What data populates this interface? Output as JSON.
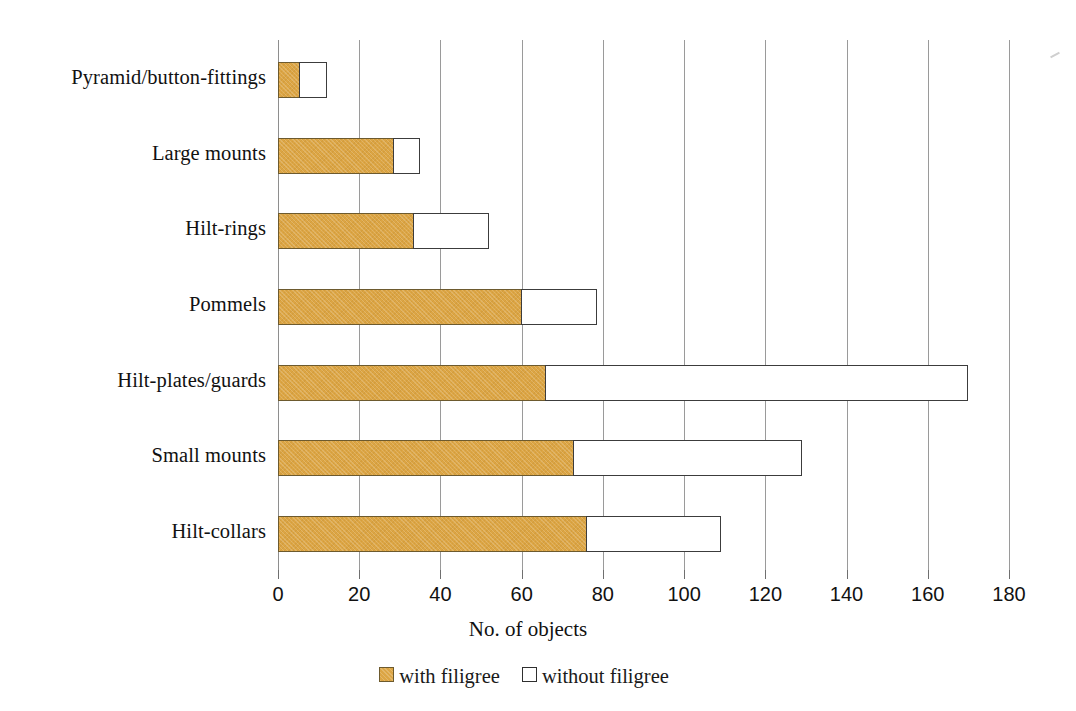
{
  "chart_data": {
    "type": "bar",
    "orientation": "horizontal",
    "stacked": true,
    "title": "",
    "xlabel": "No. of objects",
    "ylabel": "",
    "xlim": [
      0,
      180
    ],
    "xticks": [
      0,
      20,
      40,
      60,
      80,
      100,
      120,
      140,
      160,
      180
    ],
    "xtick_labels": [
      "0",
      "20",
      "40",
      "60",
      "80",
      "100",
      "120",
      "140",
      "160",
      "180"
    ],
    "grid": true,
    "grid_axis": "x",
    "legend_position": "bottom",
    "categories": [
      "Pyramid/button-fittings",
      "Large mounts",
      "Hilt-rings",
      "Pommels",
      "Hilt-plates/guards",
      "Small mounts",
      "Hilt-collars"
    ],
    "series": [
      {
        "name": "with filigree",
        "color": "#dca544",
        "values": [
          5.5,
          28.5,
          33.5,
          60,
          66,
          73,
          76
        ]
      },
      {
        "name": "without filigree",
        "color": "#ffffff",
        "values": [
          6.5,
          6.5,
          18.5,
          18.5,
          104,
          56,
          33
        ]
      }
    ],
    "totals": [
      12,
      35,
      52,
      78.5,
      170,
      129,
      109
    ]
  },
  "legend": {
    "items": [
      {
        "label": "with filigree",
        "swatch": "filigree-swatch"
      },
      {
        "label": "without filigree",
        "swatch": "plain-swatch"
      }
    ]
  },
  "colors": {
    "filigree_fill": "#dca544",
    "filigree_border": "#6d5a2e",
    "plain_fill": "#ffffff",
    "plain_border": "#3c3c3c",
    "gridline": "#9a9a9a",
    "text": "#111111",
    "background": "#ffffff"
  }
}
